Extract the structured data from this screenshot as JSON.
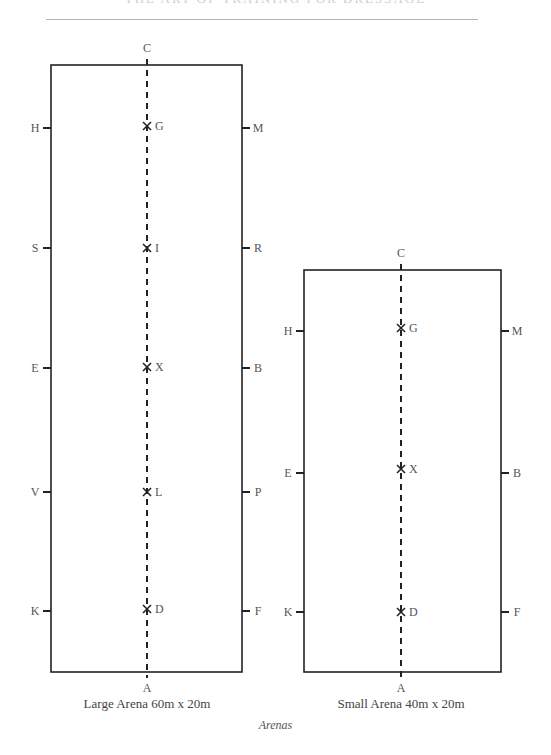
{
  "header": {
    "running_title": "THE ART OF TRAINING FOR DRESSAGE"
  },
  "figure_caption": "Arenas",
  "arenas": [
    {
      "name": "Large Arena 60m x 20m",
      "rect": {
        "x": 51,
        "y": 65,
        "w": 191,
        "h": 607
      },
      "centerline_x": 147,
      "top_letter": "C",
      "bottom_letter": "A",
      "left_markers": [
        {
          "letter": "H",
          "y": 128
        },
        {
          "letter": "S",
          "y": 248
        },
        {
          "letter": "E",
          "y": 368
        },
        {
          "letter": "V",
          "y": 492
        },
        {
          "letter": "K",
          "y": 611
        }
      ],
      "right_markers": [
        {
          "letter": "M",
          "y": 128
        },
        {
          "letter": "R",
          "y": 248
        },
        {
          "letter": "B",
          "y": 368
        },
        {
          "letter": "P",
          "y": 492
        },
        {
          "letter": "F",
          "y": 611
        }
      ],
      "center_points": [
        {
          "letter": "G",
          "y": 126
        },
        {
          "letter": "I",
          "y": 248
        },
        {
          "letter": "X",
          "y": 367
        },
        {
          "letter": "L",
          "y": 492
        },
        {
          "letter": "D",
          "y": 609
        }
      ]
    },
    {
      "name": "Small Arena 40m x 20m",
      "rect": {
        "x": 304,
        "y": 270,
        "w": 197,
        "h": 402
      },
      "centerline_x": 401,
      "top_letter": "C",
      "bottom_letter": "A",
      "left_markers": [
        {
          "letter": "H",
          "y": 331
        },
        {
          "letter": "E",
          "y": 473
        },
        {
          "letter": "K",
          "y": 612
        }
      ],
      "right_markers": [
        {
          "letter": "M",
          "y": 331
        },
        {
          "letter": "B",
          "y": 473
        },
        {
          "letter": "F",
          "y": 612
        }
      ],
      "center_points": [
        {
          "letter": "G",
          "y": 328
        },
        {
          "letter": "X",
          "y": 469
        },
        {
          "letter": "D",
          "y": 612
        }
      ]
    }
  ]
}
